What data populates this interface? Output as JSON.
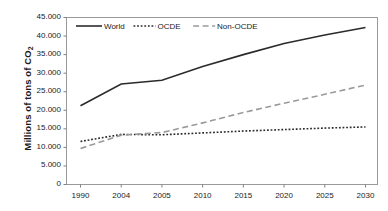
{
  "chart_data": {
    "type": "line",
    "title": "",
    "xlabel": "",
    "ylabel": "Millions of tons of CO2",
    "ylabel_display": "Millions of tons of CO",
    "ylabel_subscript": "2",
    "categories": [
      "1990",
      "2004",
      "2005",
      "2010",
      "2015",
      "2020",
      "2025",
      "2030"
    ],
    "ylim": [
      0,
      45000
    ],
    "ytick_values": [
      0,
      5000,
      10000,
      15000,
      20000,
      25000,
      30000,
      35000,
      40000,
      45000
    ],
    "ytick_labels": [
      "0",
      "5.000",
      "10.000",
      "15.000",
      "20.000",
      "25.000",
      "30.000",
      "35.000",
      "40.000",
      "45.000"
    ],
    "grid": false,
    "legend_position": "top-left-inside",
    "series": [
      {
        "name": "World",
        "values": [
          21200,
          27100,
          28100,
          31800,
          35000,
          38000,
          40300,
          42300
        ],
        "style": "solid",
        "color": "#2b2b2b",
        "width": 1.6
      },
      {
        "name": "OCDE",
        "values": [
          11600,
          13500,
          13400,
          13900,
          14400,
          14800,
          15200,
          15500
        ],
        "style": "dotted",
        "color": "#2b2b2b",
        "width": 1.6
      },
      {
        "name": "Non-OCDE",
        "values": [
          9700,
          13300,
          14000,
          16600,
          19400,
          21900,
          24300,
          26800
        ],
        "style": "dashed",
        "color": "#9a9a9a",
        "width": 1.6
      }
    ]
  },
  "legend": {
    "items": [
      {
        "label": "World"
      },
      {
        "label": "OCDE"
      },
      {
        "label": "Non-OCDE"
      }
    ]
  },
  "colors": {
    "world_line": "#2b2b2b",
    "ocde_line": "#2b2b2b",
    "non_ocde_line": "#9a9a9a",
    "axis": "#808080",
    "text": "#1a1a1a",
    "background": "#ffffff"
  }
}
